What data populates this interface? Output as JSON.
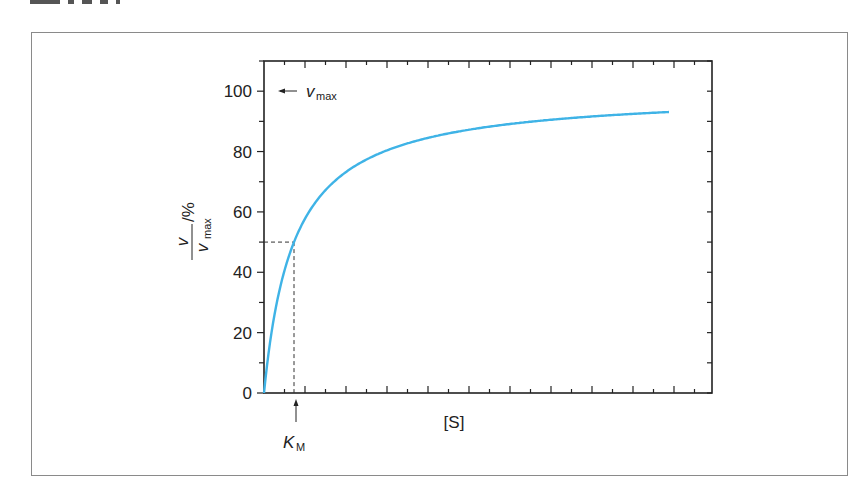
{
  "figure": {
    "frame": {
      "border_color": "#8a8a8a"
    },
    "curve_color": "#3fb3e6",
    "axis_color": "#222222"
  },
  "chart_data": {
    "type": "line",
    "title": "",
    "xlabel": "[S]",
    "ylabel": "v / v_max / %",
    "ylabel_parts": {
      "numerator": "v",
      "denominator_main": "v",
      "denominator_sub": "max",
      "unit": "/%"
    },
    "ylim": [
      0,
      110
    ],
    "yticks": [
      0,
      20,
      40,
      60,
      80,
      100
    ],
    "ytick_labels": [
      "0",
      "20",
      "40",
      "60",
      "80",
      "100"
    ],
    "xlim": [
      0,
      14
    ],
    "xticks_labeled": false,
    "grid": false,
    "legend": null,
    "model": "Michaelis-Menten: v = Vmax*[S]/(K_M+[S])",
    "K_M": 1.0,
    "Vmax_percent": 100,
    "series": [
      {
        "name": "v/vmax",
        "x": [
          0,
          0.25,
          0.5,
          0.75,
          1,
          1.5,
          2,
          3,
          4,
          5,
          6,
          7,
          8,
          9,
          10,
          11,
          12,
          13.5
        ],
        "values": [
          0,
          20,
          33.3,
          42.9,
          50,
          60,
          66.7,
          75,
          80,
          83.3,
          85.7,
          87.5,
          88.9,
          90,
          90.9,
          91.7,
          92.3,
          93.1
        ]
      }
    ],
    "annotations": [
      {
        "text_main": "v",
        "text_sub": "max",
        "arrow": "left",
        "at_y": 100,
        "label": "v_max"
      },
      {
        "text_main": "K",
        "text_sub": "M",
        "arrow": "up",
        "at_x": 1.0,
        "label": "K_M"
      },
      {
        "type": "dashed-guide",
        "y": 50,
        "x": 1.0
      }
    ]
  }
}
